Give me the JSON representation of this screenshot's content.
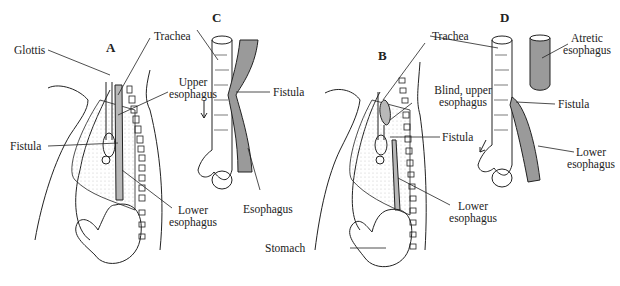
{
  "panels": {
    "a": "A",
    "b": "B",
    "c": "C",
    "d": "D"
  },
  "labels": {
    "glottis": "Glottis",
    "trachea_a": "Trachea",
    "upper_esophagus_1": "Upper",
    "upper_esophagus_2": "esophagus",
    "fistula_a": "Fistula",
    "lower_esophagus_a_1": "Lower",
    "lower_esophagus_a_2": "esophagus",
    "fistula_c": "Fistula",
    "esophagus_c": "Esophagus",
    "trachea_b": "Trachea",
    "blind_upper_1": "Blind, upper",
    "blind_upper_2": "esophagus",
    "fistula_b": "Fistula",
    "lower_esophagus_b_1": "Lower",
    "lower_esophagus_b_2": "esophagus",
    "stomach": "Stomach",
    "atretic_1": "Atretic",
    "atretic_2": "esophagus",
    "fistula_d": "Fistula",
    "lower_esophagus_d_1": "Lower",
    "lower_esophagus_d_2": "esophagus"
  },
  "colors": {
    "line": "#222222",
    "shade": "#b8b8b8",
    "dots": "#cccccc"
  }
}
